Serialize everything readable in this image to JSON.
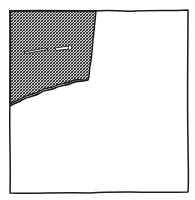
{
  "illustration": {
    "subject": "hand-drawn square with torn cross-hatched corner and broken nail",
    "colors": {
      "background": "#ffffff",
      "ink": "#1a1a1a",
      "hatch_light": "#bdbdbd"
    }
  }
}
